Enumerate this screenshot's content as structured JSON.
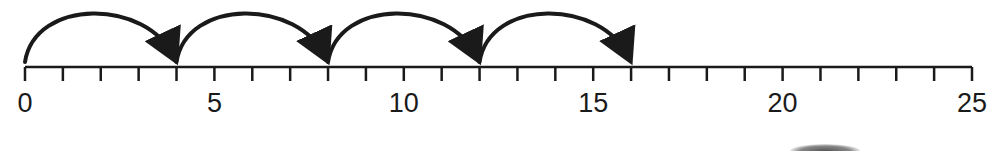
{
  "diagram": {
    "type": "number-line-skip-counting",
    "range": [
      0,
      25
    ],
    "tick_step": 1,
    "labels": [
      {
        "value": 0,
        "text": "0"
      },
      {
        "value": 5,
        "text": "5"
      },
      {
        "value": 10,
        "text": "10"
      },
      {
        "value": 15,
        "text": "15"
      },
      {
        "value": 20,
        "text": "20"
      },
      {
        "value": 25,
        "text": "25"
      }
    ],
    "jumps": [
      {
        "from": 0,
        "to": 4
      },
      {
        "from": 4,
        "to": 8
      },
      {
        "from": 8,
        "to": 12
      },
      {
        "from": 12,
        "to": 16
      }
    ],
    "jump_size": 4,
    "colors": {
      "line": "#1a1a1a",
      "background": "#ffffff"
    }
  }
}
